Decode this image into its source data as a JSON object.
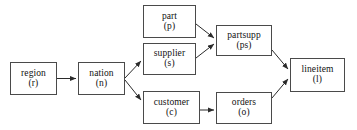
{
  "diagram": {
    "type": "directed-graph",
    "canvas": {
      "width": 357,
      "height": 130
    },
    "style": {
      "background": "#ffffff",
      "box_border": "#4a4a4a",
      "box_fill": "#ffffff",
      "text": "#111111",
      "edge": "#2b2b2b"
    },
    "nodes": [
      {
        "id": "region",
        "name": "region",
        "alias": "(r)",
        "x": 10,
        "y": 62,
        "w": 47,
        "h": 33
      },
      {
        "id": "nation",
        "name": "nation",
        "alias": "(n)",
        "x": 78,
        "y": 62,
        "w": 47,
        "h": 33
      },
      {
        "id": "part",
        "name": "part",
        "alias": "(p)",
        "x": 143,
        "y": 5,
        "w": 53,
        "h": 33
      },
      {
        "id": "supplier",
        "name": "supplier",
        "alias": "(s)",
        "x": 143,
        "y": 43,
        "w": 53,
        "h": 32
      },
      {
        "id": "customer",
        "name": "customer",
        "alias": "(c)",
        "x": 143,
        "y": 91,
        "w": 57,
        "h": 33
      },
      {
        "id": "partsupp",
        "name": "partsupp",
        "alias": "(ps)",
        "x": 216,
        "y": 25,
        "w": 56,
        "h": 31
      },
      {
        "id": "orders",
        "name": "orders",
        "alias": "(o)",
        "x": 216,
        "y": 92,
        "w": 56,
        "h": 32
      },
      {
        "id": "lineitem",
        "name": "lineitem",
        "alias": "(l)",
        "x": 290,
        "y": 58,
        "w": 55,
        "h": 34
      }
    ],
    "edges": [
      {
        "id": "region-nation",
        "from": "region",
        "to": "nation",
        "label": ""
      },
      {
        "id": "nation-supplier",
        "from": "nation",
        "to": "supplier",
        "label": ""
      },
      {
        "id": "nation-customer",
        "from": "nation",
        "to": "customer",
        "label": ""
      },
      {
        "id": "part-partsupp",
        "from": "part",
        "to": "partsupp",
        "label": ""
      },
      {
        "id": "supplier-partsupp",
        "from": "supplier",
        "to": "partsupp",
        "label": ""
      },
      {
        "id": "customer-orders",
        "from": "customer",
        "to": "orders",
        "label": ""
      },
      {
        "id": "partsupp-lineitem",
        "from": "partsupp",
        "to": "lineitem",
        "label": ""
      },
      {
        "id": "orders-lineitem",
        "from": "orders",
        "to": "lineitem",
        "label": ""
      }
    ]
  }
}
